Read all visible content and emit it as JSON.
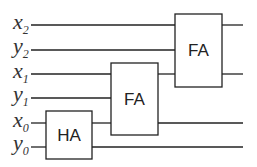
{
  "diagram": {
    "inputs": [
      {
        "var": "x",
        "sub": "2",
        "y": 25
      },
      {
        "var": "y",
        "sub": "2",
        "y": 50
      },
      {
        "var": "x",
        "sub": "1",
        "y": 74
      },
      {
        "var": "y",
        "sub": "1",
        "y": 98
      },
      {
        "var": "x",
        "sub": "0",
        "y": 123
      },
      {
        "var": "y",
        "sub": "0",
        "y": 147
      }
    ],
    "blocks": [
      {
        "id": "fa_top",
        "label": "FA"
      },
      {
        "id": "fa_mid",
        "label": "FA"
      },
      {
        "id": "ha",
        "label": "HA"
      }
    ],
    "colors": {
      "line": "#222222",
      "text": "#333333",
      "background": "#ffffff"
    }
  }
}
